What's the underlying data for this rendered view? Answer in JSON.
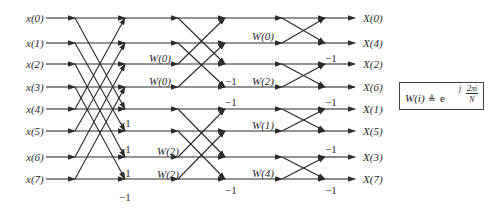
{
  "diagram": {
    "type": "8-point radix-2 decimation-in-frequency FFT butterfly flow graph",
    "inputs": [
      "x(0)",
      "x(1)",
      "x(2)",
      "x(3)",
      "x(4)",
      "x(5)",
      "x(6)",
      "x(7)"
    ],
    "outputs": [
      "X(0)",
      "X(4)",
      "X(2)",
      "X(6)",
      "X(1)",
      "X(5)",
      "X(3)",
      "X(7)"
    ],
    "minus_one": "−1",
    "stage1": {
      "twiddles": [],
      "minus_one_labels": [
        "−1",
        "−1",
        "−1",
        "−1"
      ]
    },
    "stage2": {
      "twiddles": [
        "W(0)",
        "W(0)",
        "W(2)",
        "W(2)"
      ],
      "minus_one_labels": [
        "−1",
        "−1",
        "−1",
        "−1"
      ]
    },
    "stage3": {
      "twiddles": [
        "W(0)",
        "W(2)",
        "W(1)",
        "W(4)"
      ],
      "minus_one_labels": [
        "−1",
        "−1",
        "−1",
        "−1"
      ]
    },
    "formula": {
      "lhs": "W(i)",
      "def_symbol": "≜",
      "base": "e",
      "exp_prefix": "j",
      "exp_num": "2πi",
      "exp_den": "N"
    },
    "colors": {
      "line": "#2a2a2a",
      "text": "#2a2a2a",
      "background": "#ffffff"
    }
  }
}
